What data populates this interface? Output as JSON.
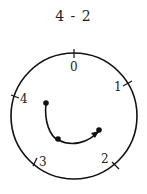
{
  "title": "4 - 2",
  "clock": {
    "modulus": 5,
    "labels": [
      "0",
      "1",
      "2",
      "3",
      "4"
    ],
    "start": "4",
    "end": "2",
    "direction": "clockwise"
  },
  "colors": {
    "stroke": "#111111",
    "text": "#222222"
  }
}
